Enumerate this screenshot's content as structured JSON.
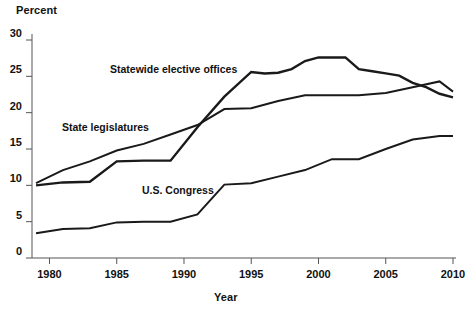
{
  "chart_data": {
    "type": "line",
    "title": "",
    "xlabel": "Year",
    "ylabel": "Percent",
    "xlim": [
      1978.7,
      2010
    ],
    "ylim": [
      0,
      30
    ],
    "grid": false,
    "legend_position": "inline-annotations",
    "xticks": [
      1980,
      1985,
      1990,
      1995,
      2000,
      2005,
      2010
    ],
    "xtick_labels": [
      "1980",
      "1985",
      "1990",
      "1995",
      "2000",
      "2005",
      "2010"
    ],
    "yticks": [
      0,
      5,
      10,
      15,
      20,
      25,
      30
    ],
    "ytick_labels": [
      "0",
      "5",
      "10",
      "15",
      "20",
      "25",
      "30"
    ],
    "series": [
      {
        "name": "Statewide elective offices",
        "color": "#1a1a1a",
        "x": [
          1979,
          1981,
          1983,
          1985,
          1987,
          1989,
          1991,
          1993,
          1995,
          1996,
          1997,
          1998,
          1999,
          2000,
          2001,
          2002,
          2003,
          2004,
          2005,
          2006,
          2007,
          2008,
          2009,
          2010
        ],
        "y": [
          10.0,
          10.4,
          10.5,
          13.3,
          13.4,
          13.4,
          18.0,
          22.2,
          25.6,
          25.4,
          25.5,
          26.0,
          27.1,
          27.6,
          27.6,
          27.6,
          26.0,
          25.7,
          25.4,
          25.1,
          24.1,
          23.5,
          22.6,
          22.1
        ]
      },
      {
        "name": "State legislatures",
        "color": "#1a1a1a",
        "x": [
          1979,
          1981,
          1983,
          1985,
          1987,
          1989,
          1991,
          1993,
          1995,
          1997,
          1999,
          2001,
          2003,
          2005,
          2007,
          2009,
          2010
        ],
        "y": [
          10.3,
          12.1,
          13.3,
          14.8,
          15.7,
          17.0,
          18.3,
          20.5,
          20.6,
          21.6,
          22.4,
          22.4,
          22.4,
          22.7,
          23.5,
          24.3,
          22.9
        ]
      },
      {
        "name": "U.S. Congress",
        "color": "#1a1a1a",
        "x": [
          1979,
          1981,
          1983,
          1985,
          1987,
          1989,
          1991,
          1993,
          1995,
          1997,
          1999,
          2001,
          2003,
          2005,
          2007,
          2009,
          2010
        ],
        "y": [
          3.4,
          4.0,
          4.1,
          4.9,
          5.0,
          5.0,
          6.0,
          10.1,
          10.3,
          11.2,
          12.1,
          13.6,
          13.6,
          15.0,
          16.3,
          16.8,
          16.8
        ]
      }
    ],
    "annotations": [
      {
        "text": "Statewide elective offices",
        "series": "Statewide elective offices"
      },
      {
        "text": "State legislatures",
        "series": "State legislatures"
      },
      {
        "text": "U.S. Congress",
        "series": "U.S. Congress"
      }
    ]
  },
  "axes": {
    "y_axis_title": "Percent",
    "x_axis_title": "Year"
  },
  "colors": {
    "line": "#1a1a1a",
    "axis": "#555555",
    "background": "#ffffff"
  }
}
